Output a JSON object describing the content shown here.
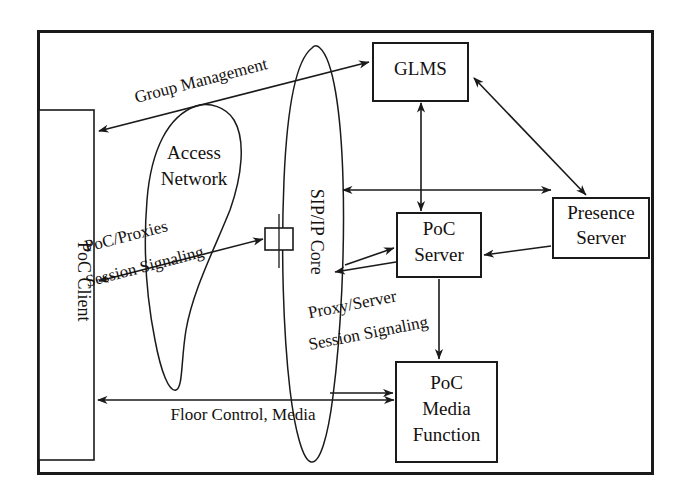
{
  "diagram": {
    "frame": {
      "stroke": "#1a1a1a"
    },
    "nodes": {
      "poc_client": {
        "label": "PoC Client",
        "shape": "rectangle",
        "orientation": "vertical"
      },
      "access_network": {
        "label_line1": "Access",
        "label_line2": "Network",
        "shape": "ellipse"
      },
      "sip_ip_core": {
        "label": "SIP/IP Core",
        "shape": "ellipse",
        "orientation": "vertical"
      },
      "proxy_node": {
        "label": "",
        "shape": "small-rectangle"
      },
      "glms": {
        "label": "GLMS",
        "shape": "rectangle"
      },
      "poc_server": {
        "label_line1": "PoC",
        "label_line2": "Server",
        "shape": "rectangle"
      },
      "presence_server": {
        "label_line1": "Presence",
        "label_line2": "Server",
        "shape": "rectangle"
      },
      "poc_media_function": {
        "label_line1": "PoC",
        "label_line2": "Media",
        "label_line3": "Function",
        "shape": "rectangle"
      }
    },
    "flows": {
      "group_management": {
        "label": "Group Management",
        "arrow": "double",
        "from": "poc_client",
        "to": "glms"
      },
      "poc_proxies_session_signaling": {
        "label_line1": "PoC/Proxies",
        "label_line2": "Session Signaling",
        "arrow": "double",
        "from": "poc_client",
        "to": "proxy_node"
      },
      "proxy_server_session_signaling": {
        "label_line1": "Proxy/Server",
        "label_line2": "Session Signaling",
        "arrow": "double",
        "from": "sip_ip_core",
        "to": "poc_server"
      },
      "floor_control_media": {
        "label": "Floor Control, Media",
        "arrow": "double",
        "from": "poc_client",
        "to": "poc_media_function"
      },
      "core_to_presence": {
        "label": "",
        "arrow": "double",
        "from": "sip_ip_core",
        "to": "presence_server"
      },
      "glms_to_poc_server": {
        "label": "",
        "arrow": "double",
        "from": "glms",
        "to": "poc_server"
      },
      "glms_to_presence": {
        "label": "",
        "arrow": "double",
        "from": "glms",
        "to": "presence_server"
      },
      "presence_to_poc_server": {
        "label": "",
        "arrow": "single",
        "from": "presence_server",
        "to": "poc_server"
      },
      "poc_server_to_media": {
        "label": "",
        "arrow": "single",
        "from": "poc_server",
        "to": "poc_media_function"
      },
      "core_to_media": {
        "label": "",
        "arrow": "single",
        "from": "sip_ip_core",
        "to": "poc_media_function"
      }
    }
  }
}
